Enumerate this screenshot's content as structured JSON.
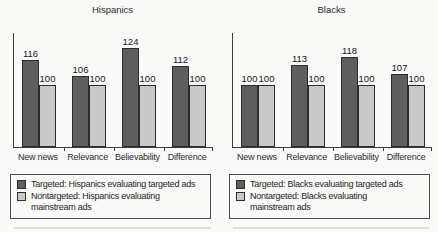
{
  "figure_titles": {
    "left": "Hispanics",
    "right": "Blacks"
  },
  "colors": {
    "bar_dark": "#5e5e5e",
    "bar_light": "#c9c9c9",
    "bar_border": "#2c2c2c",
    "axis": "#3c3c3c",
    "text": "#1e1e1e",
    "legend_border": "#4a4a4a",
    "background": "#fafaf8"
  },
  "chart_data": [
    {
      "type": "bar",
      "title": "Hispanics",
      "categories": [
        "New news",
        "Relevance",
        "Believability",
        "Difference"
      ],
      "series": [
        {
          "name": "Targeted: Hispanics evaluating targeted ads",
          "swatch": "dark",
          "values": [
            116,
            106,
            124,
            112
          ]
        },
        {
          "name": "Nontargeted: Hispanics evaluating mainstream ads",
          "swatch": "light",
          "values": [
            100,
            100,
            100,
            100
          ]
        }
      ],
      "value_labels": true,
      "xlabel": "",
      "ylabel": "",
      "ylim": [
        60,
        132
      ],
      "grid": false,
      "legend_position": "bottom"
    },
    {
      "type": "bar",
      "title": "Blacks",
      "categories": [
        "New news",
        "Relevance",
        "Believability",
        "Difference"
      ],
      "series": [
        {
          "name": "Targeted: Blacks evaluating targeted ads",
          "swatch": "dark",
          "values": [
            100,
            113,
            118,
            107
          ]
        },
        {
          "name": "Nontargeted: Blacks evaluating mainstream ads",
          "swatch": "light",
          "values": [
            100,
            100,
            100,
            100
          ]
        }
      ],
      "value_labels": true,
      "xlabel": "",
      "ylabel": "",
      "ylim": [
        60,
        132
      ],
      "grid": false,
      "legend_position": "bottom"
    }
  ]
}
